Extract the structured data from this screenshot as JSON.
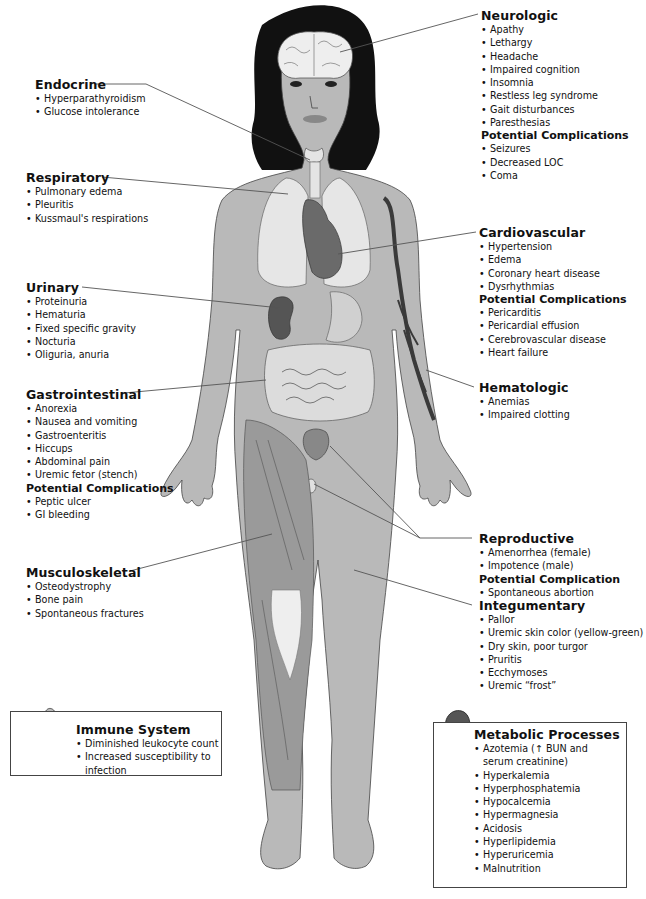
{
  "diagram": {
    "colors": {
      "skin": "#b9b9b9",
      "hair": "#111111",
      "organ_dark": "#555555",
      "organ_light": "#e4e4e4",
      "muscle": "#9a9a9a",
      "leader_line": "#555555"
    }
  },
  "sections": {
    "endocrine": {
      "title": "Endocrine",
      "items": [
        "Hyperparathyroidism",
        "Glucose intolerance"
      ]
    },
    "respiratory": {
      "title": "Respiratory",
      "items": [
        "Pulmonary edema",
        "Pleuritis",
        "Kussmaul's respirations"
      ]
    },
    "urinary": {
      "title": "Urinary",
      "items": [
        "Proteinuria",
        "Hematuria",
        "Fixed specific gravity",
        "Nocturia",
        "Oliguria, anuria"
      ]
    },
    "gastrointestinal": {
      "title": "Gastrointestinal",
      "items": [
        "Anorexia",
        "Nausea and vomiting",
        "Gastroenteritis",
        "Hiccups",
        "Abdominal pain",
        "Uremic fetor (stench)"
      ],
      "complications_title": "Potential Complications",
      "complications": [
        "Peptic ulcer",
        "GI bleeding"
      ]
    },
    "musculoskeletal": {
      "title": "Musculoskeletal",
      "items": [
        "Osteodystrophy",
        "Bone pain",
        "Spontaneous fractures"
      ]
    },
    "neurologic": {
      "title": "Neurologic",
      "items": [
        "Apathy",
        "Lethargy",
        "Headache",
        "Impaired cognition",
        "Insomnia",
        "Restless leg syndrome",
        "Gait disturbances",
        "Paresthesias"
      ],
      "complications_title": "Potential Complications",
      "complications": [
        "Seizures",
        "Decreased LOC",
        "Coma"
      ]
    },
    "cardiovascular": {
      "title": "Cardiovascular",
      "items": [
        "Hypertension",
        "Edema",
        "Coronary heart disease",
        "Dysrhythmias"
      ],
      "complications_title": "Potential Complications",
      "complications": [
        "Pericarditis",
        "Pericardial effusion",
        "Cerebrovascular disease",
        "Heart failure"
      ]
    },
    "hematologic": {
      "title": "Hematologic",
      "items": [
        "Anemias",
        "Impaired clotting"
      ]
    },
    "reproductive": {
      "title": "Reproductive",
      "items": [
        "Amenorrhea (female)",
        "Impotence (male)"
      ],
      "complications_title": "Potential Complication",
      "complications": [
        "Spontaneous abortion"
      ]
    },
    "integumentary": {
      "title": "Integumentary",
      "items": [
        "Pallor",
        "Uremic skin color (yellow-green)",
        "Dry skin, poor turgor",
        "Pruritis",
        "Ecchymoses",
        "Uremic “frost”"
      ]
    },
    "immune": {
      "title": "Immune System",
      "items": [
        "Diminished leukocyte count",
        "Increased susceptibility to infection"
      ]
    },
    "metabolic": {
      "title": "Metabolic Processes",
      "items": [
        "Azotemia (↑ BUN and serum creatinine)",
        "Hyperkalemia",
        "Hyperphosphatemia",
        "Hypocalcemia",
        "Hypermagnesia",
        "Acidosis",
        "Hyperlipidemia",
        "Hyperuricemia",
        "Malnutrition"
      ]
    }
  }
}
